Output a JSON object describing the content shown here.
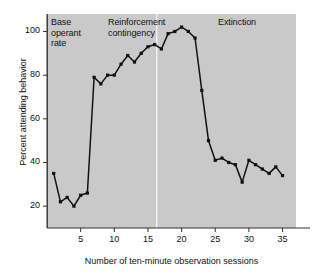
{
  "chart_data": {
    "type": "line",
    "title": "",
    "xlabel": "Number of ten-minute observation sessions",
    "ylabel": "Percent attending behavior",
    "xlim": [
      0,
      37
    ],
    "ylim": [
      10,
      108
    ],
    "grid": false,
    "legend": "none",
    "x_ticks": [
      5,
      10,
      15,
      20,
      25,
      30,
      35
    ],
    "y_ticks": [
      20,
      40,
      60,
      80,
      100
    ],
    "marker": "square",
    "line_color": "#111111",
    "plot_background": "#c9c9c9",
    "x": [
      1,
      2,
      3,
      4,
      5,
      6,
      7,
      8,
      9,
      10,
      11,
      12,
      13,
      14,
      15,
      16,
      17,
      18,
      19,
      20,
      21,
      22,
      23,
      24,
      25,
      26,
      27,
      28,
      29,
      30,
      31,
      32,
      33,
      34,
      35
    ],
    "values": [
      35,
      22,
      24,
      20,
      25,
      26,
      79,
      76,
      80,
      80,
      85,
      89,
      86,
      90,
      93,
      94,
      92,
      99,
      100,
      102,
      100,
      97,
      73,
      50,
      41,
      42,
      40,
      39,
      31,
      41,
      39,
      37,
      35,
      38,
      34
    ],
    "annotations": [
      {
        "name": "phase-base",
        "text": "Base\noperant\nrate"
      },
      {
        "name": "phase-reinforcement",
        "text": "Reinforcement\ncontingency"
      },
      {
        "name": "phase-extinction",
        "text": "Extinction"
      }
    ],
    "phase_divider": {
      "x": 16.3,
      "color": "#f2f2f2"
    }
  },
  "axes": {
    "y_title": "Percent attending behavior",
    "x_title": "Number of ten-minute observation sessions",
    "y_tick_labels": [
      "100",
      "80",
      "60",
      "40",
      "20"
    ],
    "x_tick_labels": [
      "5",
      "10",
      "15",
      "20",
      "25",
      "30",
      "35"
    ]
  },
  "annotations": {
    "base": "Base\noperant\nrate",
    "reinforcement": "Reinforcement\ncontingency",
    "extinction": "Extinction"
  }
}
